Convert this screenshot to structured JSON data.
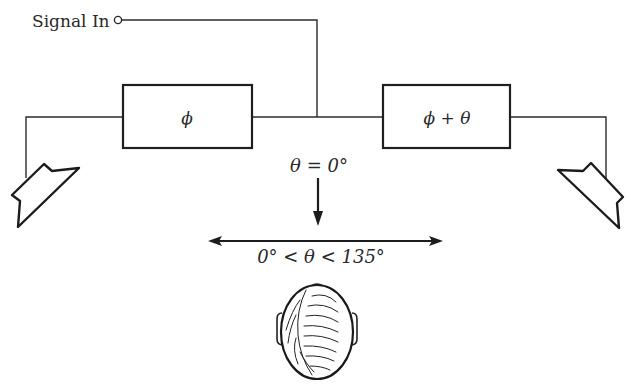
{
  "diagram": {
    "input_label": "Signal In",
    "blocks": [
      {
        "id": "phase-left",
        "label": "ϕ"
      },
      {
        "id": "phase-right",
        "label": "ϕ + θ"
      }
    ],
    "center_label": "θ = 0°",
    "range_label": "0° < θ < 135°",
    "elements": {
      "speakers": [
        "left-speaker",
        "right-speaker"
      ],
      "listener": "listener-head-top-view",
      "arrows": [
        "down-arrow",
        "double-headed-arrow"
      ]
    },
    "colors": {
      "line": "#2b2b2b",
      "background": "#ffffff"
    }
  }
}
